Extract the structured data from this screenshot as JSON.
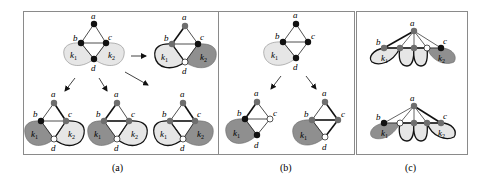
{
  "figure": {
    "colors": {
      "frame": "#8a8a8a",
      "black_node": "#111111",
      "gray_node": "#6e6e6e",
      "white_node": "#ffffff",
      "light_lobe": "#e6e6e6",
      "dark_lobe": "#8f8f8f",
      "edge": "#222222"
    },
    "panels": [
      {
        "id": "a",
        "caption": "(a)",
        "graphs": [
          {
            "id": "a-root",
            "labels": {
              "a": "a",
              "b": "b",
              "c": "c",
              "d": "d",
              "k1": "k",
              "k1_sub": "1",
              "k2": "k",
              "k2_sub": "2"
            }
          },
          {
            "id": "a-right",
            "labels": {
              "a": "a",
              "b": "b",
              "c": "c",
              "d": "d",
              "k1": "k",
              "k1_sub": "1",
              "k2": "k",
              "k2_sub": "2"
            }
          },
          {
            "id": "a-bottom-1",
            "labels": {
              "a": "a",
              "b": "b",
              "c": "c",
              "d": "d",
              "k1": "k",
              "k1_sub": "1",
              "k2": "k",
              "k2_sub": "2"
            }
          },
          {
            "id": "a-bottom-2",
            "labels": {
              "a": "a",
              "b": "b",
              "c": "c",
              "d": "d",
              "k1": "k",
              "k1_sub": "1",
              "k2": "k",
              "k2_sub": "2"
            }
          },
          {
            "id": "a-bottom-3",
            "labels": {
              "a": "a",
              "b": "b",
              "c": "c",
              "d": "d",
              "k1": "k",
              "k1_sub": "1",
              "k2": "k",
              "k2_sub": "2"
            }
          }
        ]
      },
      {
        "id": "b",
        "caption": "(b)",
        "graphs": [
          {
            "id": "b-root",
            "labels": {
              "a": "a",
              "b": "b",
              "c": "c",
              "d": "d",
              "k1": "k",
              "k1_sub": "1"
            }
          },
          {
            "id": "b-left",
            "labels": {
              "a": "a",
              "b": "b",
              "c": "c",
              "d": "d",
              "k1": "k",
              "k1_sub": "1"
            }
          },
          {
            "id": "b-right",
            "labels": {
              "a": "a",
              "b": "b",
              "c": "c",
              "d": "d",
              "k1": "k",
              "k1_sub": "1"
            }
          }
        ]
      },
      {
        "id": "c",
        "caption": "(c)",
        "graphs": [
          {
            "id": "c-top",
            "labels": {
              "a": "a",
              "b": "b",
              "c": "c",
              "k1": "k",
              "k1_sub": "1",
              "k2": "k",
              "k2_sub": "2"
            }
          },
          {
            "id": "c-bottom",
            "labels": {
              "a": "a",
              "b": "b",
              "c": "c",
              "k1": "k",
              "k1_sub": "1",
              "k2": "k",
              "k2_sub": "2"
            }
          }
        ]
      }
    ]
  }
}
